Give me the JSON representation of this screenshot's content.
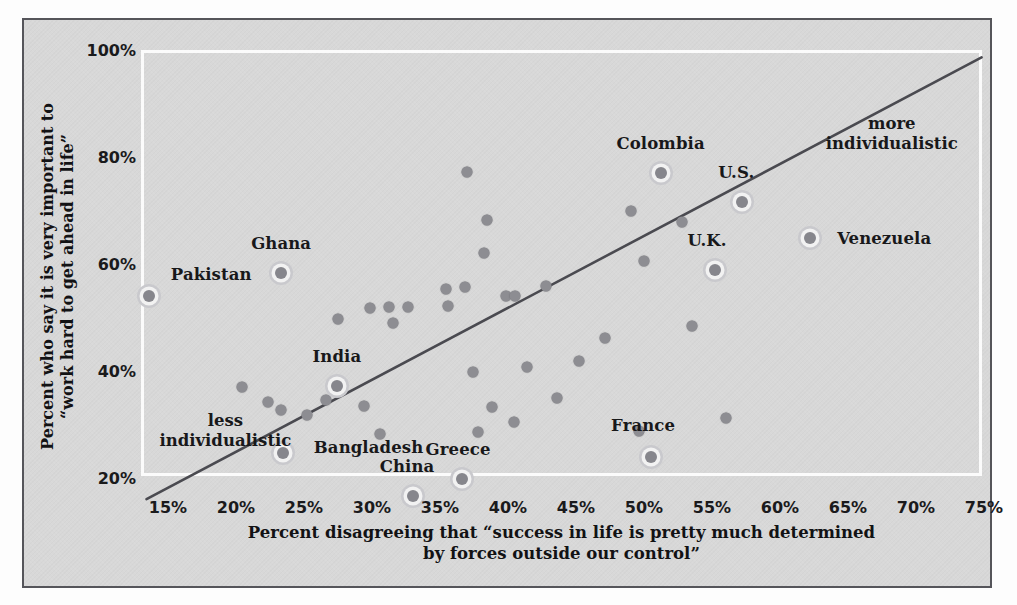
{
  "chart_data": {
    "type": "scatter",
    "title": "",
    "xlabel": "Percent disagreeing that “success in life is pretty much determined by forces outside our control”",
    "xlabel_line1": "Percent disagreeing that “success in life is pretty much determined",
    "xlabel_line2": "by forces outside our control”",
    "ylabel": "Percent who say it is very important to “work hard to get ahead in life”",
    "ylabel_line1": "Percent who say it is very important to",
    "ylabel_line2": "“work hard to get ahead in life”",
    "xlim": [
      13,
      76
    ],
    "ylim": [
      15,
      102
    ],
    "xticks": [
      "15%",
      "20%",
      "25%",
      "30%",
      "35%",
      "40%",
      "45%",
      "50%",
      "55%",
      "60%",
      "65%",
      "70%",
      "75%"
    ],
    "xtick_values": [
      15,
      20,
      25,
      30,
      35,
      40,
      45,
      50,
      55,
      60,
      65,
      70,
      75
    ],
    "yticks": [
      "100%",
      "80%",
      "60%",
      "40%",
      "20%"
    ],
    "ytick_values": [
      100,
      80,
      60,
      40,
      20
    ],
    "grid": false,
    "legend": null,
    "trendline": {
      "x0": 13.2,
      "y0": 16.6,
      "x1": 74.6,
      "y1": 99.2,
      "color": "#4a4a50"
    },
    "point_color": "#8d8d92",
    "highlight_ring_color": "#c9c9cd",
    "labeled_points": [
      {
        "label": "Pakistan",
        "x": 13.4,
        "y": 54.5,
        "label_dx": 62,
        "label_dy": -22
      },
      {
        "label": "Ghana",
        "x": 23.1,
        "y": 58.8,
        "label_dx": 0,
        "label_dy": -30
      },
      {
        "label": "India",
        "x": 27.2,
        "y": 37.8,
        "label_dx": 0,
        "label_dy": -30
      },
      {
        "label": "Bangladesh",
        "x": 23.2,
        "y": 25.2,
        "label_dx": 86,
        "label_dy": -6
      },
      {
        "label": "China",
        "x": 32.8,
        "y": 17.2,
        "label_dx": -6,
        "label_dy": -30
      },
      {
        "label": "Greece",
        "x": 36.4,
        "y": 20.4,
        "label_dx": -4,
        "label_dy": -30
      },
      {
        "label": "France",
        "x": 50.3,
        "y": 24.5,
        "label_dx": -8,
        "label_dy": -32
      },
      {
        "label": "Colombia",
        "x": 51.0,
        "y": 77.5,
        "label_dx": 0,
        "label_dy": -30
      },
      {
        "label": "U.S.",
        "x": 57.0,
        "y": 72.1,
        "label_dx": -6,
        "label_dy": -30
      },
      {
        "label": "U.K.",
        "x": 55.0,
        "y": 59.4,
        "label_dx": -8,
        "label_dy": -30
      },
      {
        "label": "Venezuela",
        "x": 62.0,
        "y": 65.5,
        "label_dx": 74,
        "label_dy": 0
      }
    ],
    "unlabeled_points": [
      {
        "x": 20.2,
        "y": 37.6
      },
      {
        "x": 22.1,
        "y": 34.7
      },
      {
        "x": 23.1,
        "y": 33.3
      },
      {
        "x": 25.0,
        "y": 32.4
      },
      {
        "x": 26.4,
        "y": 35.2
      },
      {
        "x": 27.3,
        "y": 50.3
      },
      {
        "x": 29.2,
        "y": 34.0
      },
      {
        "x": 29.6,
        "y": 52.3
      },
      {
        "x": 30.4,
        "y": 28.8
      },
      {
        "x": 31.0,
        "y": 52.6
      },
      {
        "x": 31.3,
        "y": 49.5
      },
      {
        "x": 32.4,
        "y": 52.5
      },
      {
        "x": 35.2,
        "y": 55.9
      },
      {
        "x": 35.4,
        "y": 52.7
      },
      {
        "x": 36.6,
        "y": 56.2
      },
      {
        "x": 36.8,
        "y": 77.8
      },
      {
        "x": 37.2,
        "y": 40.3
      },
      {
        "x": 37.6,
        "y": 29.1
      },
      {
        "x": 38.0,
        "y": 62.6
      },
      {
        "x": 38.2,
        "y": 68.7
      },
      {
        "x": 38.6,
        "y": 33.8
      },
      {
        "x": 39.6,
        "y": 54.6
      },
      {
        "x": 40.3,
        "y": 54.5
      },
      {
        "x": 40.2,
        "y": 31.0
      },
      {
        "x": 41.2,
        "y": 41.4
      },
      {
        "x": 42.6,
        "y": 56.5
      },
      {
        "x": 43.4,
        "y": 35.5
      },
      {
        "x": 45.0,
        "y": 42.5
      },
      {
        "x": 46.9,
        "y": 46.7
      },
      {
        "x": 48.8,
        "y": 70.5
      },
      {
        "x": 49.4,
        "y": 29.3
      },
      {
        "x": 49.8,
        "y": 61.2
      },
      {
        "x": 52.6,
        "y": 68.5
      },
      {
        "x": 53.3,
        "y": 49.0
      },
      {
        "x": 55.8,
        "y": 31.8
      }
    ],
    "annotations": [
      {
        "text": "less individualistic",
        "line1": "less",
        "line2": "individualistic",
        "x": 19.0,
        "y": 29.5
      },
      {
        "text": "more individualistic",
        "line1": "more",
        "line2": "individualistic",
        "x": 68.0,
        "y": 85.0
      }
    ]
  },
  "figure": {
    "background_color": "#d8d8d8",
    "border_color": "#55555a",
    "plot_border_color": "#fbfbfb"
  }
}
